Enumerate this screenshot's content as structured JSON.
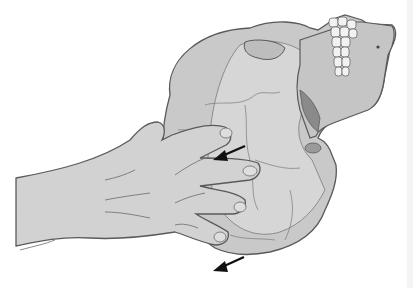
{
  "illustration": {
    "subject": "hand-supporting-skull",
    "colors": {
      "background": "#ffffff",
      "bone": "#c9c9c9",
      "bone_shadow": "#a9a9a9",
      "bone_light": "#dadada",
      "skin": "#d2d2d2",
      "outline": "#5a5a5a",
      "teeth": "#f2f2f2",
      "arrow": "#111111"
    },
    "arrows": [
      {
        "name": "upper-arrow",
        "direction": "down-left"
      },
      {
        "name": "lower-arrow",
        "direction": "down-left"
      }
    ]
  }
}
